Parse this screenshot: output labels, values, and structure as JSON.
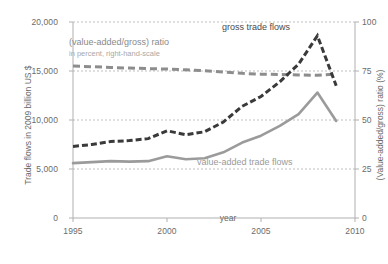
{
  "axes": {
    "left": {
      "title": "Trade flows in 2009 billion US $",
      "ticks": [
        "0",
        "5,000",
        "10,000",
        "15,000",
        "20,000"
      ],
      "min": 0,
      "max": 20000
    },
    "right": {
      "title": "(Value-added/gross) ratio (%)",
      "ticks": [
        "0",
        "25",
        "50",
        "75",
        "100"
      ],
      "min": 0,
      "max": 100
    },
    "x": {
      "title": "year",
      "ticks": [
        "1995",
        "2000",
        "2005",
        "2010"
      ],
      "min": 1995,
      "max": 2010
    }
  },
  "labels": {
    "gross": "gross trade flows",
    "value_added": "value-added trade flows",
    "ratio": "(value-added/gross) ratio",
    "ratio_sub": "in percent, right-hand-scale"
  },
  "colors": {
    "gross": "#3a3a3a",
    "value_added": "#9b9b9b",
    "ratio": "#8d8d8d",
    "gridline": "#bfbfbf",
    "axis": "#b0b0b0",
    "text": "#6b6b6b"
  },
  "chart_data": {
    "type": "line",
    "title": "",
    "xlabel": "year",
    "ylabel": "Trade flows in 2009 billion US $",
    "y2label": "(Value-added/gross) ratio (%)",
    "xlim": [
      1995,
      2010
    ],
    "ylim": [
      0,
      20000
    ],
    "y2lim": [
      0,
      100
    ],
    "grid": true,
    "legend": "inline-annotations",
    "x": [
      1995,
      1996,
      1997,
      1998,
      1999,
      2000,
      2001,
      2002,
      2003,
      2004,
      2005,
      2006,
      2007,
      2008,
      2009
    ],
    "series": [
      {
        "name": "gross trade flows",
        "axis": "left",
        "style": "dashed",
        "color": "#3a3a3a",
        "values": [
          7300,
          7500,
          7800,
          7900,
          8100,
          8900,
          8500,
          8800,
          9800,
          11400,
          12400,
          13900,
          15700,
          18600,
          13500
        ]
      },
      {
        "name": "value-added trade flows",
        "axis": "left",
        "style": "solid",
        "color": "#9b9b9b",
        "values": [
          5600,
          5700,
          5800,
          5750,
          5800,
          6300,
          6000,
          6100,
          6700,
          7700,
          8400,
          9400,
          10600,
          12800,
          9900
        ]
      },
      {
        "name": "(value-added/gross) ratio",
        "axis": "right",
        "style": "dashed",
        "color": "#8d8d8d",
        "values": [
          77.5,
          77.2,
          76.8,
          76.5,
          76.2,
          76.0,
          75.6,
          75.2,
          74.5,
          73.8,
          73.4,
          73.2,
          73.0,
          72.8,
          73.5
        ]
      }
    ]
  }
}
